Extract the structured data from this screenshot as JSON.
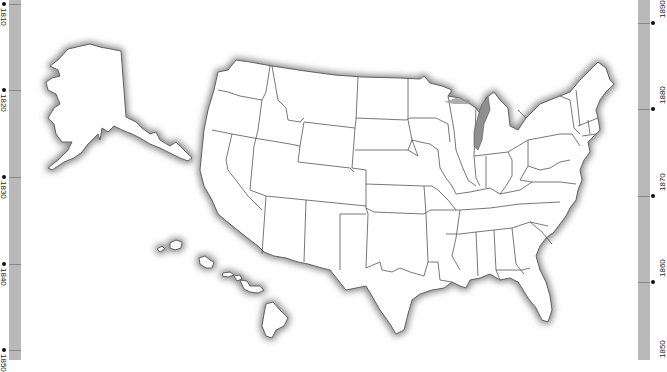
{
  "map": {
    "title": "United States blank outline map",
    "regions": [
      "Alaska",
      "Hawaii",
      "Contiguous United States"
    ],
    "style": "white state fills with dark outlines and grey coastal shadow"
  },
  "timeline_left": {
    "ticks": [
      {
        "label": "1810",
        "y": 4
      },
      {
        "label": "1820",
        "y": 90
      },
      {
        "label": "1830",
        "y": 177
      },
      {
        "label": "1840",
        "y": 264
      },
      {
        "label": "1850",
        "y": 350
      }
    ]
  },
  "timeline_right": {
    "ticks": [
      {
        "label": "1890",
        "y": 23
      },
      {
        "label": "1880",
        "y": 109
      },
      {
        "label": "1870",
        "y": 196
      },
      {
        "label": "1860",
        "y": 282
      },
      {
        "label": "1850",
        "y": 355
      }
    ]
  },
  "colors": {
    "background": "#ffffff",
    "strip": "#b9b9b9",
    "state_stroke": "#555555",
    "shadow": "#7a7a7a"
  }
}
